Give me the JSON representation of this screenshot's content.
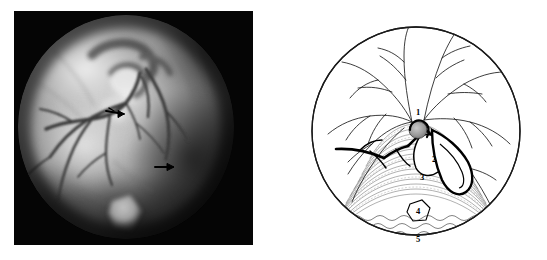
{
  "figure": {
    "type": "two-panel-medical-figure",
    "panels": [
      {
        "id": "fundus-photograph",
        "kind": "photograph",
        "description": "Grayscale wide-field fundus photograph of the retina showing retinal vessels, the optic disc region, a pale elevated lesion and two black marker arrows",
        "background_color": "#050505",
        "annotations": [
          {
            "name": "arrow-upper",
            "glyph": "arrow-right",
            "x": 118,
            "y": 103
          },
          {
            "name": "arrow-lower",
            "glyph": "arrow-right",
            "x": 168,
            "y": 157
          }
        ]
      },
      {
        "id": "schematic-diagram",
        "kind": "line-drawing",
        "description": "Circular schematic fundus drawing showing branching retinal vessels radiating from the disc, a dome of concentric contour lines representing a retinal detachment, and wavy lines at the inferior periphery",
        "outline_color": "#1a1a1a",
        "fill_color": "#ffffff",
        "labels": [
          {
            "id": "1",
            "text": "1",
            "x": 426,
            "y": 113,
            "meaning": "optic-disc"
          },
          {
            "id": "2",
            "text": "2",
            "x": 449,
            "y": 154,
            "meaning": "tear-flap"
          },
          {
            "id": "3",
            "text": "3",
            "x": 430,
            "y": 177,
            "meaning": "detached-retina"
          },
          {
            "id": "4",
            "text": "4",
            "x": 423,
            "y": 205,
            "meaning": "outlined-lesion"
          },
          {
            "id": "5",
            "text": "5",
            "x": 423,
            "y": 236,
            "meaning": "inferior-periphery"
          }
        ]
      }
    ]
  }
}
